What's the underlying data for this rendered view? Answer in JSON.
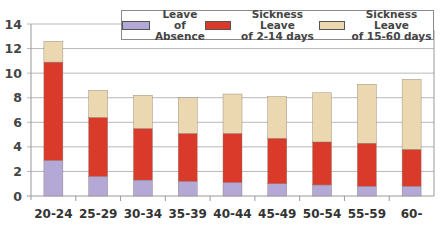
{
  "chart_data": {
    "type": "bar",
    "stacked": true,
    "title": "",
    "xlabel": "",
    "ylabel": "",
    "ylim": [
      0,
      14
    ],
    "yticks": [
      0,
      2,
      4,
      6,
      8,
      10,
      12,
      14
    ],
    "grid": true,
    "legend_position": "top-right",
    "categories": [
      "20-24",
      "25-29",
      "30-34",
      "35-39",
      "40-44",
      "45-49",
      "50-54",
      "55-59",
      "60-"
    ],
    "series": [
      {
        "name": "Leave of Absence",
        "color": "#b3a8d6",
        "values": [
          2.9,
          1.6,
          1.3,
          1.2,
          1.1,
          1.0,
          0.9,
          0.8,
          0.8
        ]
      },
      {
        "name": "Sickness Leave of 2-14 days",
        "color": "#d93a2a",
        "values": [
          8.0,
          4.8,
          4.2,
          3.9,
          4.0,
          3.7,
          3.5,
          3.5,
          3.0
        ]
      },
      {
        "name": "Sickness Leave of 15-60 days",
        "color": "#ecd8b0",
        "values": [
          1.7,
          2.2,
          2.7,
          2.9,
          3.2,
          3.4,
          4.0,
          4.8,
          5.7
        ]
      }
    ]
  },
  "legend": {
    "items": [
      {
        "line1": "Leave of",
        "line2": "Absence",
        "color": "#b3a8d6"
      },
      {
        "line1": "Sickness Leave",
        "line2": "of 2-14 days",
        "color": "#d93a2a"
      },
      {
        "line1": "Sickness Leave",
        "line2": "of 15-60 days",
        "color": "#ecd8b0"
      }
    ]
  }
}
